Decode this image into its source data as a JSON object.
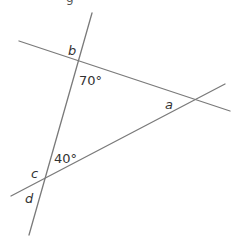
{
  "diagram": {
    "type": "angles at intersecting lines",
    "header_fragment": "g",
    "line_color": "#7a7a7a",
    "text_color": "#333333",
    "lines": [
      {
        "id": "steep-line",
        "x1": 92,
        "y1": 13,
        "x2": 29,
        "y2": 235
      },
      {
        "id": "upper-line",
        "x1": 19,
        "y1": 41,
        "x2": 230,
        "y2": 111
      },
      {
        "id": "lower-line",
        "x1": 11,
        "y1": 196,
        "x2": 225,
        "y2": 84
      }
    ],
    "labels": {
      "b": "b",
      "angle_70": "70°",
      "a": "a",
      "angle_40": "40°",
      "c": "c",
      "d": "d"
    }
  }
}
